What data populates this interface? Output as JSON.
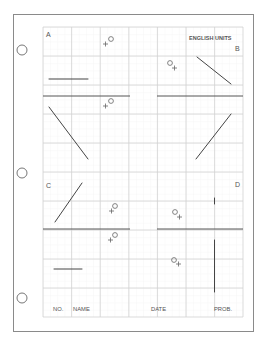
{
  "sheet": {
    "title": "ENGLISH UNITS",
    "quadrant_labels": {
      "a": "A",
      "b": "B",
      "c": "C",
      "d": "D"
    },
    "title_block": {
      "no_label": "NO.",
      "name_label": "NAME",
      "date_label": "DATE",
      "prob_label": "PROB."
    },
    "colors": {
      "paper": "#ffffff",
      "border": "#8a8a8a",
      "grid_major": "#d4d4d4",
      "grid_minor": "#ececec",
      "ink": "#444444",
      "text": "#555555"
    },
    "binder_holes": 3,
    "markers": [
      {
        "id": "marker-a",
        "symbol": "+O",
        "x": 109,
        "y": 15
      },
      {
        "id": "marker-b",
        "symbol": "O+",
        "x": 173,
        "y": 65
      },
      {
        "id": "marker-left-mid",
        "symbol": "+O",
        "x": 109,
        "y": 105
      },
      {
        "id": "marker-c",
        "symbol": "+O",
        "x": 113,
        "y": 208
      },
      {
        "id": "marker-c-lower",
        "symbol": "+O",
        "x": 112,
        "y": 237
      },
      {
        "id": "marker-d",
        "symbol": "O+",
        "x": 178,
        "y": 213
      },
      {
        "id": "marker-d-lower",
        "symbol": "O+",
        "x": 176,
        "y": 262
      }
    ]
  }
}
